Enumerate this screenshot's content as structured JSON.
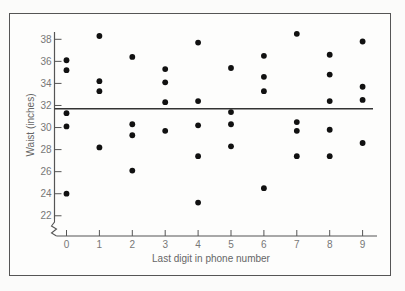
{
  "chart_data": {
    "type": "scatter",
    "title": "",
    "xlabel": "Last digit in phone number",
    "ylabel": "Waist (inches)",
    "x_ticks": [
      "0",
      "1",
      "2",
      "3",
      "4",
      "5",
      "6",
      "7",
      "8",
      "9"
    ],
    "y_ticks": [
      "22",
      "24",
      "26",
      "28",
      "30",
      "32",
      "34",
      "36",
      "38"
    ],
    "ylim": [
      21,
      38.8
    ],
    "xlim": [
      -0.35,
      9.45
    ],
    "y_axis_break": true,
    "grid": false,
    "legend": null,
    "reference_line": {
      "type": "horizontal",
      "y": 31.7,
      "label": ""
    },
    "series": [
      {
        "name": "waist",
        "points": [
          {
            "x": 0,
            "y": 36.1
          },
          {
            "x": 0,
            "y": 35.2
          },
          {
            "x": 0,
            "y": 31.3
          },
          {
            "x": 0,
            "y": 30.1
          },
          {
            "x": 0,
            "y": 24.0
          },
          {
            "x": 1,
            "y": 38.3
          },
          {
            "x": 1,
            "y": 34.2
          },
          {
            "x": 1,
            "y": 33.3
          },
          {
            "x": 1,
            "y": 28.2
          },
          {
            "x": 2,
            "y": 36.4
          },
          {
            "x": 2,
            "y": 30.3
          },
          {
            "x": 2,
            "y": 29.3
          },
          {
            "x": 2,
            "y": 26.1
          },
          {
            "x": 3,
            "y": 35.3
          },
          {
            "x": 3,
            "y": 34.1
          },
          {
            "x": 3,
            "y": 32.3
          },
          {
            "x": 3,
            "y": 29.7
          },
          {
            "x": 4,
            "y": 37.7
          },
          {
            "x": 4,
            "y": 32.4
          },
          {
            "x": 4,
            "y": 30.2
          },
          {
            "x": 4,
            "y": 27.4
          },
          {
            "x": 4,
            "y": 23.2
          },
          {
            "x": 5,
            "y": 35.4
          },
          {
            "x": 5,
            "y": 31.4
          },
          {
            "x": 5,
            "y": 30.3
          },
          {
            "x": 5,
            "y": 28.3
          },
          {
            "x": 6,
            "y": 36.5
          },
          {
            "x": 6,
            "y": 34.6
          },
          {
            "x": 6,
            "y": 33.3
          },
          {
            "x": 6,
            "y": 24.5
          },
          {
            "x": 7,
            "y": 38.5
          },
          {
            "x": 7,
            "y": 30.5
          },
          {
            "x": 7,
            "y": 29.7
          },
          {
            "x": 7,
            "y": 27.4
          },
          {
            "x": 8,
            "y": 36.6
          },
          {
            "x": 8,
            "y": 34.8
          },
          {
            "x": 8,
            "y": 32.4
          },
          {
            "x": 8,
            "y": 29.8
          },
          {
            "x": 8,
            "y": 27.4
          },
          {
            "x": 9,
            "y": 37.8
          },
          {
            "x": 9,
            "y": 33.7
          },
          {
            "x": 9,
            "y": 32.5
          },
          {
            "x": 9,
            "y": 28.6
          }
        ]
      }
    ]
  },
  "colors": {
    "point": "#111111",
    "axis": "#555555",
    "mean_line": "#333333",
    "frame": "#555555",
    "text": "#777777"
  }
}
